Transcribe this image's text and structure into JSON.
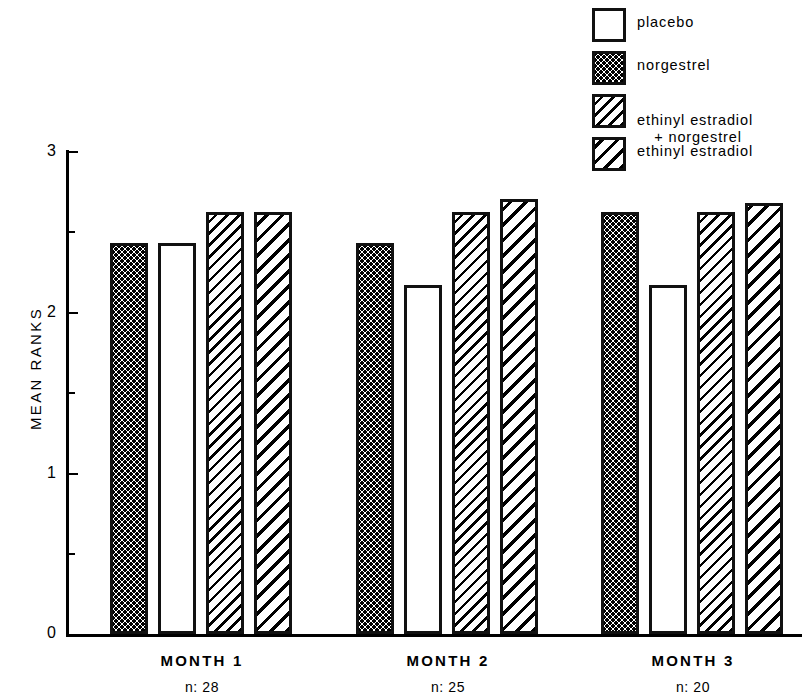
{
  "chart_data": {
    "type": "bar",
    "title": "",
    "xlabel": "",
    "ylabel": "MEAN RANKS",
    "ylim": [
      0,
      3
    ],
    "yticks": [
      "0",
      "1",
      "2",
      "3"
    ],
    "yminor": [
      0.5,
      1.5,
      2.5
    ],
    "grid": false,
    "legend_position": "top-right",
    "categories": [
      "MONTH 1",
      "MONTH 2",
      "MONTH 3"
    ],
    "category_sublabels": [
      "n: 28",
      "n: 25",
      "n: 20"
    ],
    "bar_order": [
      "norgestrel",
      "placebo",
      "ethinyl estradiol + norgestrel",
      "ethinyl estradiol"
    ],
    "series": [
      {
        "name": "norgestrel",
        "fill": "dots",
        "values": [
          2.43,
          2.43,
          2.62
        ]
      },
      {
        "name": "placebo",
        "fill": "plain",
        "values": [
          2.43,
          2.17,
          2.17
        ]
      },
      {
        "name": "ethinyl estradiol + norgestrel",
        "fill": "hatch-a",
        "values": [
          2.62,
          2.62,
          2.62
        ]
      },
      {
        "name": "ethinyl estradiol",
        "fill": "hatch-b",
        "values": [
          2.62,
          2.7,
          2.68
        ]
      }
    ]
  },
  "legend": {
    "items": [
      {
        "label": "placebo",
        "fill": "plain",
        "line2": ""
      },
      {
        "label": "norgestrel",
        "fill": "dots",
        "line2": ""
      },
      {
        "label": "ethinyl estradiol",
        "fill": "hatch-a",
        "line2": "+ norgestrel"
      },
      {
        "label": "ethinyl estradiol",
        "fill": "hatch-b",
        "line2": ""
      }
    ]
  },
  "axes": {
    "y_title": "MEAN RANKS",
    "y_tick_3": "3",
    "y_tick_2": "2",
    "y_tick_1": "1",
    "y_tick_0": "0"
  },
  "groups": [
    {
      "name": "MONTH 1",
      "n": "n: 28"
    },
    {
      "name": "MONTH 2",
      "n": "n: 25"
    },
    {
      "name": "MONTH 3",
      "n": "n: 20"
    }
  ],
  "colors": {
    "ink": "#000000",
    "background": "#ffffff"
  }
}
